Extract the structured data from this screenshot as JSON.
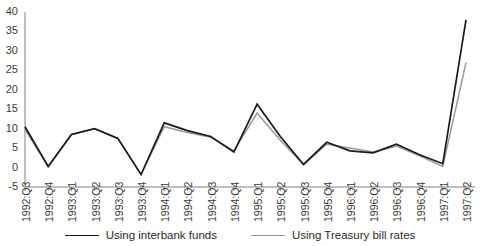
{
  "chart_data": {
    "type": "line",
    "title": "",
    "subtitle": "",
    "xlabel": "",
    "ylabel": "",
    "grid": false,
    "legend_position": "bottom",
    "ylim": [
      -5,
      40
    ],
    "yticks": [
      40,
      35,
      30,
      25,
      20,
      15,
      10,
      5,
      0,
      -5
    ],
    "categories": [
      "1992:Q3",
      "1992:Q4",
      "1993:Q1",
      "1993:Q2",
      "1993:Q3",
      "1993:Q4",
      "1994:Q1",
      "1994:Q2",
      "1994:Q3",
      "1994:Q4",
      "1995:Q1",
      "1995:Q2",
      "1995:Q3",
      "1995:Q4",
      "1996:Q1",
      "1996:Q2",
      "1996:Q3",
      "1996:Q4",
      "1997:Q1",
      "1997:Q2"
    ],
    "series": [
      {
        "name": "Using interbank funds",
        "color": "#1a1a1a",
        "values": [
          10.5,
          0.3,
          8.5,
          10.0,
          7.5,
          -1.8,
          11.5,
          9.5,
          8.0,
          4.0,
          16.3,
          8.0,
          0.8,
          6.5,
          4.3,
          3.8,
          6.0,
          3.3,
          1.0,
          38.0
        ]
      },
      {
        "name": "Using Treasury bill rates",
        "color": "#9a9a9a",
        "values": [
          9.8,
          0.2,
          8.5,
          10.0,
          7.5,
          -1.8,
          10.5,
          9.0,
          7.8,
          4.3,
          14.0,
          7.0,
          0.8,
          6.0,
          5.0,
          4.0,
          5.5,
          3.0,
          0.3,
          27.0
        ]
      }
    ]
  },
  "legend": {
    "entries": [
      {
        "label": "Using interbank funds",
        "color": "#1a1a1a"
      },
      {
        "label": "Using Treasury bill rates",
        "color": "#9a9a9a"
      }
    ]
  },
  "axes": {
    "axis_color": "#808080",
    "tick_color": "#808080",
    "label_color": "#3b3b3b"
  }
}
